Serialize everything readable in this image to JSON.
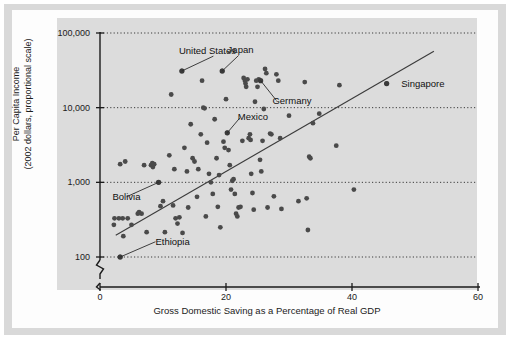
{
  "figure": {
    "caption_none": ""
  },
  "chart_data": {
    "type": "scatter",
    "title": "",
    "xlabel": "Gross Domestic Saving as a Percentage of Real GDP",
    "ylabel": "Per Capita Income",
    "ylabel_line1": "Per Capita Income",
    "ylabel_line2": "(2002 dollars, proportional scale)",
    "yscale": "log",
    "xscale": "linear",
    "xlim": [
      0,
      60
    ],
    "ylim": [
      100,
      100000
    ],
    "xticks": [
      0,
      20,
      40,
      60
    ],
    "xtick_labels": [
      "0",
      "20",
      "40",
      "60"
    ],
    "yticks": [
      100,
      1000,
      10000,
      100000
    ],
    "ytick_labels": [
      "100",
      "1,000",
      "10,000",
      "100,000"
    ],
    "grid": "horizontal-dotted",
    "axis_break": true,
    "legend": "none",
    "trendline": {
      "label": "regression line",
      "x_start": 2.5,
      "y_start": 196,
      "x_end": 53.0,
      "y_end": 57000
    },
    "annotations": [
      {
        "label": "United States",
        "x": 13.0,
        "y": 31000,
        "text_x": 18.0,
        "text_y": 49000
      },
      {
        "label": "Japan",
        "x": 19.4,
        "y": 31000,
        "text_x": 22.0,
        "text_y": 50000
      },
      {
        "label": "Germany",
        "x": 25.5,
        "y": 23000,
        "text_x": 28.0,
        "text_y": 12500
      },
      {
        "label": "Singapore",
        "x": 45.5,
        "y": 21000,
        "text_x": 47.5,
        "text_y": 21000
      },
      {
        "label": "Mexico",
        "x": 20.2,
        "y": 4600,
        "text_x": 22.2,
        "text_y": 7300
      },
      {
        "label": "Bolivia",
        "x": 9.3,
        "y": 1000,
        "text_x": 4.2,
        "text_y": 640
      },
      {
        "label": "Ethiopia",
        "x": 3.2,
        "y": 100,
        "text_x": 8.8,
        "text_y": 160
      }
    ],
    "points": [
      [
        2.2,
        270
      ],
      [
        2.3,
        330
      ],
      [
        3.0,
        330
      ],
      [
        3.2,
        1750
      ],
      [
        3.2,
        100
      ],
      [
        3.6,
        330
      ],
      [
        3.7,
        190
      ],
      [
        4.0,
        1900
      ],
      [
        4.4,
        330
      ],
      [
        5.0,
        270
      ],
      [
        6.0,
        380
      ],
      [
        6.2,
        400
      ],
      [
        6.6,
        380
      ],
      [
        7.0,
        1700
      ],
      [
        7.4,
        215
      ],
      [
        8.1,
        1700
      ],
      [
        8.3,
        1800
      ],
      [
        8.4,
        1600
      ],
      [
        8.6,
        1750
      ],
      [
        9.3,
        1000
      ],
      [
        9.6,
        480
      ],
      [
        10.0,
        560
      ],
      [
        10.3,
        215
      ],
      [
        11.0,
        2300
      ],
      [
        11.3,
        15000
      ],
      [
        11.6,
        490
      ],
      [
        11.8,
        1500
      ],
      [
        12.0,
        330
      ],
      [
        12.3,
        280
      ],
      [
        12.6,
        340
      ],
      [
        13.0,
        31000
      ],
      [
        13.1,
        210
      ],
      [
        13.4,
        2900
      ],
      [
        13.8,
        1400
      ],
      [
        14.0,
        460
      ],
      [
        14.4,
        6000
      ],
      [
        14.7,
        2100
      ],
      [
        15.0,
        1900
      ],
      [
        15.4,
        640
      ],
      [
        15.6,
        1500
      ],
      [
        16.0,
        4400
      ],
      [
        16.2,
        23000
      ],
      [
        16.4,
        10000
      ],
      [
        16.6,
        9800
      ],
      [
        16.8,
        350
      ],
      [
        17.0,
        3400
      ],
      [
        17.3,
        1300
      ],
      [
        17.6,
        1000
      ],
      [
        17.9,
        700
      ],
      [
        18.2,
        7000
      ],
      [
        18.5,
        2100
      ],
      [
        18.7,
        470
      ],
      [
        18.9,
        1250
      ],
      [
        19.1,
        250
      ],
      [
        19.4,
        31000
      ],
      [
        19.6,
        3500
      ],
      [
        19.8,
        2900
      ],
      [
        20.0,
        13000
      ],
      [
        20.2,
        4600
      ],
      [
        20.4,
        2700
      ],
      [
        20.6,
        1700
      ],
      [
        20.8,
        800
      ],
      [
        21.0,
        1050
      ],
      [
        21.2,
        1100
      ],
      [
        21.4,
        700
      ],
      [
        21.6,
        380
      ],
      [
        21.8,
        350
      ],
      [
        22.0,
        460
      ],
      [
        22.3,
        470
      ],
      [
        22.6,
        3600
      ],
      [
        22.8,
        25000
      ],
      [
        23.0,
        23000
      ],
      [
        23.1,
        21000
      ],
      [
        23.2,
        19000
      ],
      [
        23.4,
        24000
      ],
      [
        23.6,
        3900
      ],
      [
        23.8,
        4400
      ],
      [
        23.9,
        3700
      ],
      [
        24.0,
        1300
      ],
      [
        24.2,
        720
      ],
      [
        24.4,
        430
      ],
      [
        24.6,
        12000
      ],
      [
        24.8,
        23000
      ],
      [
        25.0,
        19000
      ],
      [
        25.2,
        24000
      ],
      [
        25.4,
        2000
      ],
      [
        25.6,
        1400
      ],
      [
        25.8,
        3600
      ],
      [
        26.0,
        9600
      ],
      [
        26.2,
        33000
      ],
      [
        26.4,
        29000
      ],
      [
        26.6,
        460
      ],
      [
        27.0,
        4500
      ],
      [
        27.2,
        4400
      ],
      [
        27.6,
        650
      ],
      [
        28.0,
        28000
      ],
      [
        28.3,
        23000
      ],
      [
        28.6,
        3900
      ],
      [
        28.8,
        440
      ],
      [
        30.0,
        7800
      ],
      [
        31.5,
        560
      ],
      [
        32.5,
        22000
      ],
      [
        32.8,
        610
      ],
      [
        33.0,
        230
      ],
      [
        33.2,
        2200
      ],
      [
        33.4,
        2100
      ],
      [
        33.8,
        6200
      ],
      [
        34.8,
        8300
      ],
      [
        37.5,
        3100
      ],
      [
        38.0,
        20000
      ],
      [
        40.3,
        800
      ],
      [
        45.5,
        21000
      ]
    ]
  }
}
